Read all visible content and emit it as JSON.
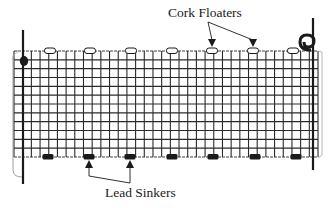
{
  "diagram": {
    "type": "gill-net-illustration",
    "colors": {
      "ink": "#1a1a1a",
      "grid": "#2a2a2a",
      "background": "#ffffff"
    },
    "net": {
      "top_y": 51,
      "bottom_y": 157,
      "left_x": 14,
      "right_x": 318,
      "grid_columns": 35,
      "grid_rows": 12
    },
    "poles": [
      {
        "name": "left-pole",
        "x": 23,
        "y1": 30,
        "y2": 184
      },
      {
        "name": "right-pole",
        "x": 313,
        "y1": 18,
        "y2": 170
      }
    ],
    "floats_x": [
      50,
      90,
      131,
      172,
      212,
      253,
      293
    ],
    "sinkers_x": [
      48,
      89,
      130,
      172,
      213,
      255,
      296
    ],
    "labels": {
      "floaters": "Cork Floaters",
      "sinkers": "Lead Sinkers"
    },
    "callouts": {
      "floaters": {
        "label_x": 168,
        "label_y": 6,
        "origin": [
          208,
          22
        ],
        "targets_x": [
          212,
          253
        ]
      },
      "sinkers": {
        "label_x": 105,
        "label_y": 186,
        "origin": [
          130,
          183
        ],
        "targets_x": [
          89,
          130
        ]
      }
    }
  }
}
